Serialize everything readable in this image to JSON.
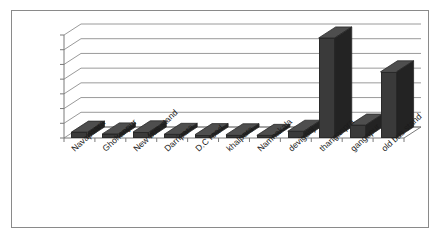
{
  "chart_data": {
    "type": "bar",
    "title": "",
    "subtitle": "",
    "xlabel": "",
    "ylabel": "",
    "categories": [
      "Navapaara",
      "Ghohanpur",
      "New bus stand",
      "Darripara",
      "D.C road",
      "khalpara",
      "Namnakala",
      "deviganj",
      "thanganpra",
      "gangapur",
      "old bus stand"
    ],
    "values": [
      4000,
      2800,
      4200,
      2500,
      2300,
      2200,
      1800,
      4600,
      68000,
      8800,
      45000
    ],
    "ylim": [
      0,
      70000
    ],
    "ytick_labels": [
      "0",
      "10000",
      "20000",
      "30000",
      "40000",
      "50000",
      "60000",
      "70000"
    ],
    "ytick_values": [
      0,
      10000,
      20000,
      30000,
      40000,
      50000,
      60000,
      70000
    ],
    "grid": true,
    "legend": false,
    "legend_position": "none",
    "style": "3d-column",
    "colors": {
      "bar_front": "#3a3a3a",
      "bar_top": "#4e4e4e",
      "bar_side": "#232323",
      "gridline": "#9a9a9a",
      "axis": "#7a7a7a",
      "frame_border": "#8a8a8a",
      "background": "#ffffff",
      "text": "#1b1b1b"
    }
  }
}
